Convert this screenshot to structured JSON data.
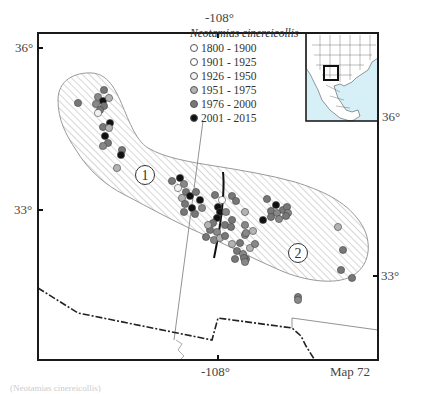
{
  "map": {
    "species": "Neotamias cinereicollis",
    "map_label": "Map 72",
    "axis_labels": {
      "top_lon": "-108°",
      "bottom_lon": "-108°",
      "left_lat_top": "36°",
      "left_lat_bottom": "33°",
      "right_lat_inset": "36°",
      "right_lat": "33°"
    },
    "region_markers": [
      "1",
      "2"
    ],
    "legend": [
      {
        "label": "1800 - 1900",
        "color": "#ffffff"
      },
      {
        "label": "1901 - 1925",
        "color": "#ffffff"
      },
      {
        "label": "1926 - 1950",
        "color": "#f2f2f2"
      },
      {
        "label": "1951 - 1975",
        "color": "#b3b3b3"
      },
      {
        "label": "1976 - 2000",
        "color": "#777777"
      },
      {
        "label": "2001 - 2015",
        "color": "#111111"
      }
    ],
    "colors": {
      "frame": "#1a1a1a",
      "hatch": "#999999",
      "inset_water": "#d7f0f7"
    },
    "footer_text": "(Neotamias cinereicollis)"
  }
}
